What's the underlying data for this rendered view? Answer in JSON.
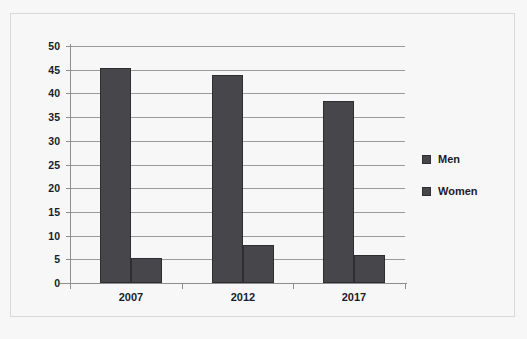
{
  "chart_data": {
    "type": "bar",
    "title": "",
    "subtitle": "",
    "xlabel": "",
    "ylabel": "",
    "categories": [
      "2007",
      "2012",
      "2017"
    ],
    "series": [
      {
        "name": "Men",
        "values": [
          45.3,
          43.8,
          38.3
        ],
        "color": "#47474b"
      },
      {
        "name": "Women",
        "values": [
          5.3,
          8.0,
          6.0
        ],
        "color": "#47474b"
      }
    ],
    "ylim": [
      0,
      50
    ],
    "ytick_step": 5,
    "ytick_labels": [
      "0",
      "5",
      "10",
      "15",
      "20",
      "25",
      "30",
      "35",
      "40",
      "45",
      "50"
    ],
    "xtick_labels": [
      "2007",
      "2012",
      "2017"
    ],
    "grid": "horizontal",
    "legend_position": "right",
    "annotations": []
  },
  "legend": {
    "entries": [
      {
        "label": "Men"
      },
      {
        "label": "Women"
      }
    ]
  },
  "colors": {
    "bar_fill": "#47474b",
    "bar_stroke": "#2e2e31",
    "gridline": "#9a9a9a",
    "axis": "#8e8e8e",
    "text": "#1b1b2c",
    "background": "#f7f7f7",
    "frame_border": "#d8d8d8"
  }
}
